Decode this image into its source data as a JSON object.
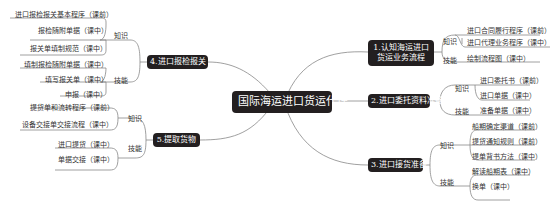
{
  "title": "国际海运进口货运代理",
  "branches": [
    {
      "id": "b1",
      "label": "1.认知海运进口\n货运业务流程",
      "line1": "1.认知海运进口",
      "line2": "货运业务流程",
      "groups": [
        {
          "category": "知识",
          "items": [
            "进口合同履行程序（课前）",
            "进口代理业务程序（课中）"
          ]
        },
        {
          "category": "技能",
          "items": [
            "绘制流程图（课中）"
          ]
        }
      ]
    },
    {
      "id": "b2",
      "label": "2.进口委托资料准备",
      "groups": [
        {
          "category": "知识",
          "items": [
            "进口委托书（课前）",
            "进口单据（课中）"
          ]
        },
        {
          "category": "技能",
          "items": [
            "准备单据（课中）"
          ]
        }
      ]
    },
    {
      "id": "b3",
      "label": "3.进口接货准备",
      "groups": [
        {
          "category": "知识",
          "items": [
            "船期确定渠道（课前）",
            "提货通知规则（课前）",
            "提单背书方法（课中）"
          ]
        },
        {
          "category": "技能",
          "items": [
            "解读船期表（课中）",
            "换单（课中）"
          ]
        }
      ]
    },
    {
      "id": "b4",
      "label": "4.进口报检报关",
      "groups": [
        {
          "category": "知识",
          "items": [
            "进口报检报关基本程序（课前）",
            "报检随附单据（课中）",
            "报关单填制规范（课中）"
          ]
        },
        {
          "category": "技能",
          "items": [
            "填制报检随附单据（课中）",
            "填写报关单（课中）",
            "申报（课中）"
          ]
        }
      ]
    },
    {
      "id": "b5",
      "label": "5.提取货物",
      "groups": [
        {
          "category": "知识",
          "items": [
            "提货单和流转程序（课前）",
            "设备交接单交接流程（课中）"
          ]
        },
        {
          "category": "技能",
          "items": [
            "进口提货（课中）",
            "单据交接（课中）"
          ]
        }
      ]
    }
  ],
  "colors": {
    "node_bg": "#231f20",
    "node_text": "#ffffff",
    "line": "#777777",
    "text": "#333333"
  }
}
